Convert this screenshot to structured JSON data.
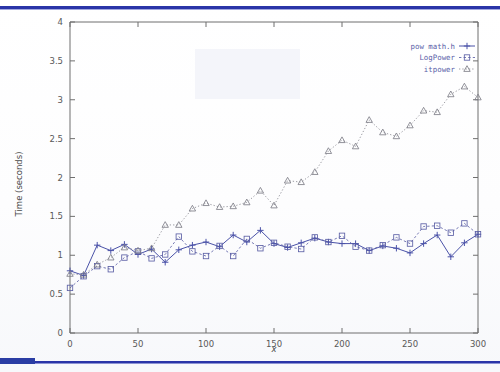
{
  "slide": {
    "accent_color": "#2a35a8",
    "background_color": "#ffffff",
    "top_rule_name": "top-accent-rule",
    "bottom_rule_name": "bottom-accent-rule"
  },
  "chart_data": {
    "type": "line",
    "title": "",
    "xlabel": "x",
    "ylabel": "Time (seconds)",
    "xlim": [
      0,
      300
    ],
    "ylim": [
      0,
      4
    ],
    "xticks": [
      0,
      50,
      100,
      150,
      200,
      250,
      300
    ],
    "xtick_labels": [
      "0",
      "50",
      "100",
      "150",
      "200",
      "250",
      "300"
    ],
    "yticks": [
      0,
      0.5,
      1,
      1.5,
      2,
      2.5,
      3,
      3.5,
      4
    ],
    "ytick_labels": [
      "0",
      "0.5",
      "1",
      "1.5",
      "2",
      "2.5",
      "3",
      "3.5",
      "4"
    ],
    "grid": false,
    "legend_position": "top-right",
    "x": [
      0,
      10,
      20,
      30,
      40,
      50,
      60,
      70,
      80,
      90,
      100,
      110,
      120,
      130,
      140,
      150,
      160,
      170,
      180,
      190,
      200,
      210,
      220,
      230,
      240,
      250,
      260,
      270,
      280,
      290,
      300
    ],
    "series": [
      {
        "name": "pow math.h",
        "marker": "plus",
        "color": "#4a52a8",
        "linestyle": "solid",
        "values": [
          0.8,
          0.74,
          1.13,
          1.06,
          1.14,
          1.01,
          1.08,
          0.91,
          1.07,
          1.13,
          1.17,
          1.11,
          1.26,
          1.17,
          1.32,
          1.15,
          1.1,
          1.16,
          1.22,
          1.17,
          1.15,
          1.15,
          1.06,
          1.12,
          1.09,
          1.03,
          1.15,
          1.26,
          0.98,
          1.16,
          1.27
        ]
      },
      {
        "name": "LogPower",
        "marker": "square",
        "color": "#5d61a6",
        "linestyle": "dashed",
        "values": [
          0.58,
          0.73,
          0.86,
          0.82,
          0.97,
          1.05,
          0.96,
          1.01,
          1.24,
          1.05,
          0.99,
          1.12,
          0.99,
          1.21,
          1.09,
          1.16,
          1.11,
          1.08,
          1.23,
          1.17,
          1.25,
          1.11,
          1.06,
          1.13,
          1.23,
          1.15,
          1.37,
          1.38,
          1.29,
          1.41,
          1.27
        ]
      },
      {
        "name": "itpower",
        "marker": "triangle",
        "color": "#7e7e88",
        "linestyle": "dotted",
        "values": [
          0.76,
          0.75,
          0.88,
          0.97,
          1.1,
          1.06,
          1.09,
          1.39,
          1.39,
          1.6,
          1.67,
          1.62,
          1.63,
          1.68,
          1.83,
          1.64,
          1.96,
          1.94,
          2.07,
          2.34,
          2.48,
          2.4,
          2.74,
          2.58,
          2.53,
          2.67,
          2.86,
          2.84,
          3.07,
          3.17,
          3.03
        ]
      }
    ]
  }
}
